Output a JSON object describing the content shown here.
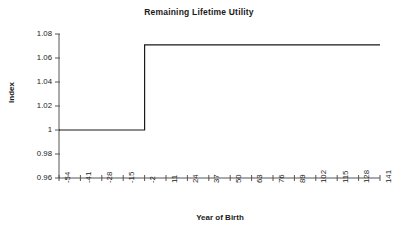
{
  "chart_data": {
    "type": "line",
    "title": "Remaining Lifetime Utility",
    "xlabel": "Year of Birth",
    "ylabel": "Index",
    "x": [
      -54,
      -41,
      -28,
      -15,
      -2,
      11,
      24,
      37,
      50,
      63,
      76,
      89,
      102,
      115,
      128,
      141
    ],
    "xtick_labels": [
      "-54",
      "-41",
      "-28",
      "-15",
      "-2",
      "11",
      "24",
      "37",
      "50",
      "63",
      "76",
      "89",
      "102",
      "115",
      "128",
      "141"
    ],
    "ytick_labels": [
      "1.08",
      "1.06",
      "1.04",
      "1.02",
      "1",
      "0.98",
      "0.96"
    ],
    "yticks": [
      1.08,
      1.06,
      1.04,
      1.02,
      1.0,
      0.98,
      0.96
    ],
    "ylim": [
      0.96,
      1.08
    ],
    "xlim": [
      -54,
      141
    ],
    "grid": false,
    "legend": "none",
    "series": [
      {
        "name": "Remaining Lifetime Utility",
        "color": "#1a1a1a",
        "style": "step",
        "values": [
          1.0,
          1.0,
          1.0,
          1.0,
          1.071,
          1.071,
          1.071,
          1.071,
          1.071,
          1.071,
          1.071,
          1.071,
          1.071,
          1.071,
          1.071,
          1.071
        ]
      }
    ],
    "annotations": [
      "Step function: utility index equals 1.00 for birth years -54 through -2, then jumps to approximately 1.071 and stays flat through birth year 141."
    ]
  }
}
